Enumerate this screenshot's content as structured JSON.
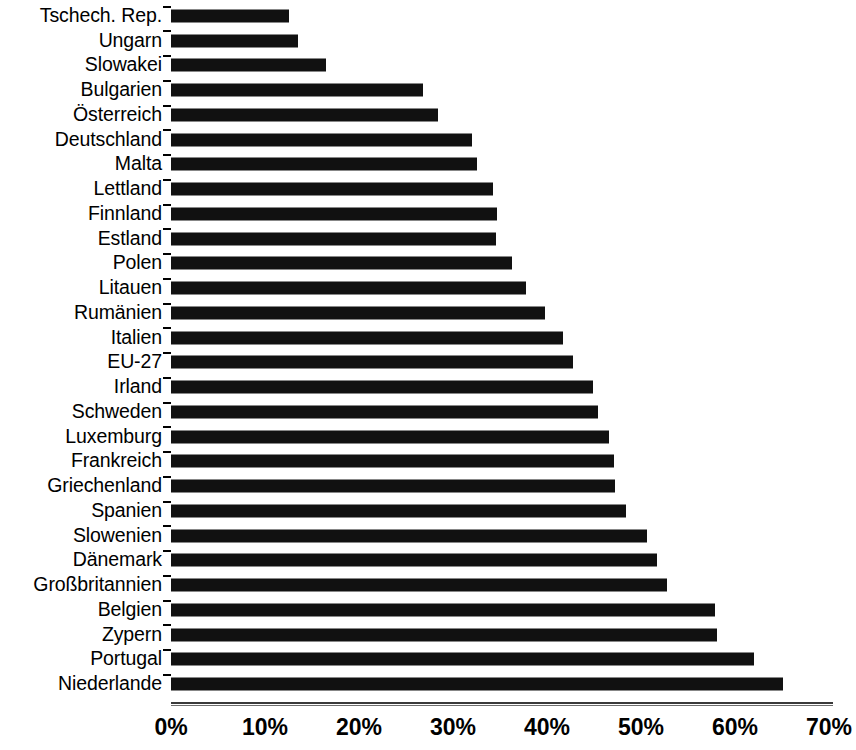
{
  "chart_data": {
    "type": "bar",
    "orientation": "horizontal",
    "title": "",
    "subtitle": "",
    "xlabel": "",
    "ylabel": "",
    "xlim": [
      0,
      70
    ],
    "xunit": "%",
    "xticks": [
      "0%",
      "10%",
      "20%",
      "30%",
      "40%",
      "50%",
      "60%",
      "70%"
    ],
    "xtick_values": [
      0,
      10,
      20,
      30,
      40,
      50,
      60,
      70
    ],
    "grid": false,
    "legend": null,
    "bar_color": "#111111",
    "axis_color": "#3a3a3a",
    "background": "#ffffff",
    "categories": [
      "Tschech. Rep.",
      "Ungarn",
      "Slowakei",
      "Bulgarien",
      "Österreich",
      "Deutschland",
      "Malta",
      "Lettland",
      "Finnland",
      "Estland",
      "Polen",
      "Litauen",
      "Rumänien",
      "Italien",
      "EU-27",
      "Irland",
      "Schweden",
      "Luxemburg",
      "Frankreich",
      "Griechenland",
      "Spanien",
      "Slowenien",
      "Dänemark",
      "Großbritannien",
      "Belgien",
      "Zypern",
      "Portugal",
      "Niederlande"
    ],
    "values": [
      12.6,
      13.5,
      16.5,
      26.8,
      28.4,
      32.0,
      32.6,
      34.3,
      34.7,
      34.6,
      36.3,
      37.8,
      39.8,
      41.7,
      42.8,
      44.9,
      45.4,
      46.6,
      47.1,
      47.2,
      48.4,
      50.6,
      51.7,
      52.8,
      57.9,
      58.1,
      62.0,
      65.1
    ]
  }
}
